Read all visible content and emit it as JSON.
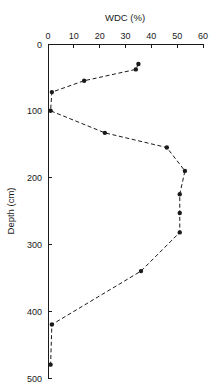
{
  "chart_data": {
    "type": "line",
    "title": "WDC (%)",
    "xlabel": "WDC (%)",
    "ylabel": "Depth (cm)",
    "xlim": [
      0,
      60
    ],
    "ylim": [
      0,
      500
    ],
    "x_axis_position": "top",
    "y_axis_inverted": true,
    "grid": false,
    "legend": null,
    "xticks": [
      0,
      10,
      20,
      30,
      40,
      50,
      60
    ],
    "xtick_labels": [
      "0",
      "10",
      "20",
      "30",
      "40",
      "50",
      "60"
    ],
    "yticks": [
      0,
      100,
      200,
      300,
      400,
      500
    ],
    "ytick_labels": [
      "0",
      "100",
      "200",
      "300",
      "400",
      "500"
    ],
    "marker": "filled-circle",
    "linestyle": "dashed",
    "series": [
      {
        "name": "WDC profile",
        "x": [
          35,
          34,
          14,
          1.5,
          1,
          22,
          46,
          53,
          51,
          51,
          51,
          36,
          1.5,
          1
        ],
        "depth": [
          30,
          38,
          55,
          72,
          100,
          133,
          155,
          190,
          225,
          253,
          282,
          340,
          420,
          480
        ]
      }
    ],
    "points": [
      {
        "wdc": 35,
        "depth": 30
      },
      {
        "wdc": 34,
        "depth": 38
      },
      {
        "wdc": 14,
        "depth": 55
      },
      {
        "wdc": 1.5,
        "depth": 72
      },
      {
        "wdc": 1,
        "depth": 100
      },
      {
        "wdc": 22,
        "depth": 133
      },
      {
        "wdc": 46,
        "depth": 155
      },
      {
        "wdc": 53,
        "depth": 190
      },
      {
        "wdc": 51,
        "depth": 225
      },
      {
        "wdc": 51,
        "depth": 253
      },
      {
        "wdc": 51,
        "depth": 282
      },
      {
        "wdc": 36,
        "depth": 340
      },
      {
        "wdc": 1.5,
        "depth": 420
      },
      {
        "wdc": 1,
        "depth": 480
      }
    ]
  },
  "colors": {
    "axis": "#1a1a1a",
    "line": "#1a1a1a",
    "marker": "#1a1a1a",
    "background": "#ffffff"
  }
}
